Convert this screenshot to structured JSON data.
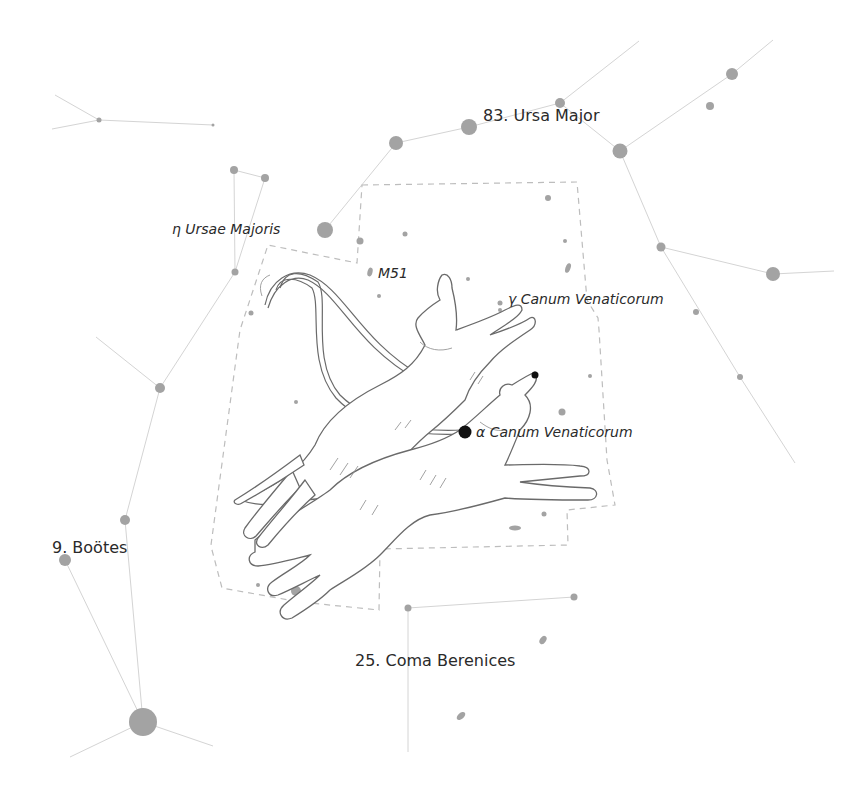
{
  "map": {
    "title": "Canes Venatici star map",
    "colors": {
      "background": "#ffffff",
      "star": "#a3a3a3",
      "key_star": "#111111",
      "constellation_line": "#d4d4d4",
      "boundary": "#bdbdbd",
      "label": "#2a2a2a"
    },
    "constellation_labels": [
      {
        "id": "ursa-major",
        "text": "83. Ursa Major",
        "x": 483,
        "y": 121
      },
      {
        "id": "bootes",
        "text": "9. Boötes",
        "x": 52,
        "y": 553
      },
      {
        "id": "coma-berenices",
        "text": "25. Coma Berenices",
        "x": 355,
        "y": 666
      }
    ],
    "star_labels": [
      {
        "id": "eta-ursae-majoris",
        "text": "η Ursae Majoris",
        "x": 172,
        "y": 234
      },
      {
        "id": "m51",
        "text": "M51",
        "x": 378,
        "y": 278
      },
      {
        "id": "gamma-canum-venaticorum",
        "text": "γ Canum Venaticorum",
        "x": 508,
        "y": 304
      },
      {
        "id": "alpha-canum-venaticorum",
        "text": "α Canum Venaticorum",
        "x": 476,
        "y": 437
      }
    ],
    "illustration": "two hunting dogs on leashes (Asterion and Chara)"
  }
}
